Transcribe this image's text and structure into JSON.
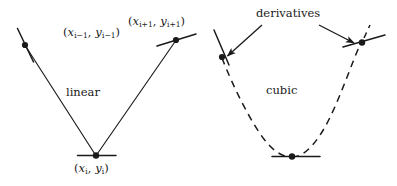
{
  "figure": {
    "width": 397,
    "height": 186,
    "background": "#ffffff",
    "ink_color": "#1a1a1a"
  },
  "labels": {
    "point_left": {
      "open": "(",
      "x_var": "x",
      "x_sub": "i−1",
      "comma": ",",
      "y_var": "y",
      "y_sub": "i−1",
      "close": ")",
      "plain": "(x_{i-1}, y_{i-1})"
    },
    "point_right": {
      "open": "(",
      "x_var": "x",
      "x_sub": "i+1",
      "comma": ",",
      "y_var": "y",
      "y_sub": "i+1",
      "close": ")",
      "plain": "(x_{i+1}, y_{i+1})"
    },
    "point_mid": {
      "open": "(",
      "x_var": "x",
      "x_sub": "i",
      "comma": ",",
      "y_var": "y",
      "y_sub": "i",
      "close": ")",
      "plain": "(x_i, y_i)"
    },
    "linear": "linear",
    "cubic": "cubic",
    "derivatives": "derivatives"
  },
  "diagram_data": {
    "type": "annotated-geometry",
    "description": "Comparison of linear interpolation (left) and cubic interpolation (right) through three sample points, with short tangent segments marking derivatives.",
    "panels": [
      {
        "name": "linear",
        "interpolation": "linear",
        "line_style": "solid",
        "nodes": [
          {
            "id": "i-1",
            "label": "(x_{i-1}, y_{i-1})",
            "x": 25,
            "y": 45,
            "tangent_angle_deg": -64,
            "tangent_length": 38
          },
          {
            "id": "i",
            "label": "(x_i, y_i)",
            "x": 96,
            "y": 156,
            "tangent_angle_deg": 0,
            "tangent_length": 38
          },
          {
            "id": "i+1",
            "label": "(x_{i+1}, y_{i+1})",
            "x": 176,
            "y": 40,
            "tangent_angle_deg": 17,
            "tangent_length": 40
          }
        ],
        "segments": [
          {
            "from": "i-1",
            "to": "i"
          },
          {
            "from": "i",
            "to": "i+1"
          }
        ]
      },
      {
        "name": "cubic",
        "interpolation": "cubic",
        "line_style": "dashed",
        "dash_pattern": "7 5",
        "nodes": [
          {
            "id": "i-1",
            "x": 222,
            "y": 57,
            "tangent_angle_deg": -66,
            "tangent_length": 34
          },
          {
            "id": "i",
            "x": 292,
            "y": 156,
            "tangent_angle_deg": 0,
            "tangent_length": 46
          },
          {
            "id": "i+1",
            "x": 362,
            "y": 42,
            "tangent_angle_deg": 16,
            "tangent_length": 44
          }
        ]
      }
    ],
    "annotations": [
      {
        "text": "derivatives",
        "x": 290,
        "y": 15,
        "arrows": [
          {
            "from_x": 262,
            "from_y": 24,
            "to_x": 226,
            "to_y": 57
          },
          {
            "from_x": 320,
            "from_y": 24,
            "to_x": 355,
            "to_y": 43
          }
        ]
      }
    ]
  }
}
